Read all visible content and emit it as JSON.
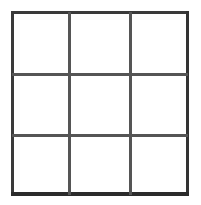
{
  "figure": {
    "name": "3x3 grid",
    "type": "grid",
    "rows": 3,
    "columns": 3,
    "colors": {
      "background": "#ffffff",
      "cell_fill": "#ffffff",
      "outer_border": "#333333",
      "inner_divider": "#555555"
    },
    "cells": [
      {
        "row": 0,
        "column": 0,
        "content": ""
      },
      {
        "row": 0,
        "column": 1,
        "content": ""
      },
      {
        "row": 0,
        "column": 2,
        "content": ""
      },
      {
        "row": 1,
        "column": 0,
        "content": ""
      },
      {
        "row": 1,
        "column": 1,
        "content": ""
      },
      {
        "row": 1,
        "column": 2,
        "content": ""
      },
      {
        "row": 2,
        "column": 0,
        "content": ""
      },
      {
        "row": 2,
        "column": 1,
        "content": ""
      },
      {
        "row": 2,
        "column": 2,
        "content": ""
      }
    ]
  }
}
